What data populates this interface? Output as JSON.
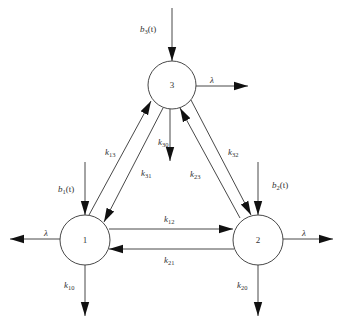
{
  "diagram": {
    "nodes": [
      {
        "id": "1",
        "label": "1",
        "cx": 85,
        "cy": 240,
        "r": 25
      },
      {
        "id": "2",
        "label": "2",
        "cx": 258,
        "cy": 240,
        "r": 25
      },
      {
        "id": "3",
        "label": "3",
        "cx": 172,
        "cy": 85,
        "r": 24
      }
    ],
    "inputs": {
      "b1": {
        "base": "b",
        "sub": "1",
        "suffix": "(t)"
      },
      "b2": {
        "base": "b",
        "sub": "2",
        "suffix": "(t)"
      },
      "b3": {
        "base": "b",
        "sub": "3",
        "suffix": "(t)"
      }
    },
    "rates": {
      "k12": {
        "base": "k",
        "sub": "12"
      },
      "k21": {
        "base": "k",
        "sub": "21"
      },
      "k13": {
        "base": "k",
        "sub": "13"
      },
      "k31": {
        "base": "k",
        "sub": "31"
      },
      "k23": {
        "base": "k",
        "sub": "23"
      },
      "k32": {
        "base": "k",
        "sub": "32"
      },
      "k10": {
        "base": "k",
        "sub": "10"
      },
      "k20": {
        "base": "k",
        "sub": "20"
      },
      "k30": {
        "base": "k",
        "sub": "30"
      }
    },
    "lambda": "λ"
  }
}
